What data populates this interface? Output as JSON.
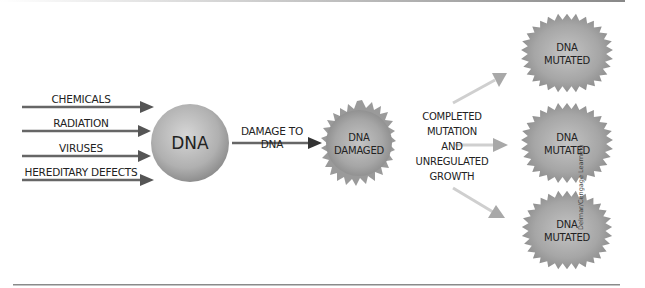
{
  "diagram": {
    "causes": [
      "CHEMICALS",
      "RADIATION",
      "VIRUSES",
      "HEREDITARY DEFECTS"
    ],
    "center_node": "DNA",
    "damage_label": [
      "DAMAGE TO",
      "DNA"
    ],
    "damaged_node": [
      "DNA",
      "DAMAGED"
    ],
    "process_label": [
      "COMPLETED",
      "MUTATION",
      "AND",
      "UNREGULATED",
      "GROWTH"
    ],
    "mutated_nodes": [
      {
        "line1": "DNA",
        "line2": "MUTATED"
      },
      {
        "line1": "DNA",
        "line2": "MUTATED"
      },
      {
        "line1": "DNA",
        "line2": "MUTATED"
      }
    ],
    "credit": "Delmar/Cengage Learning"
  },
  "colors": {
    "arrow_dark": "#555555",
    "arrow_light": "#c8c8c8",
    "sphere": "#a8a8a8",
    "rule": "#8a8a8a"
  }
}
